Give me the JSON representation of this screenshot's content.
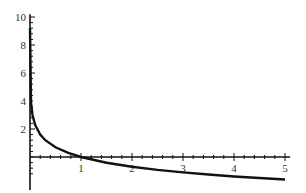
{
  "chart_data": {
    "type": "line",
    "title": "",
    "xlabel": "",
    "ylabel": "",
    "xlim": [
      0,
      5
    ],
    "ylim": [
      -1.7,
      10
    ],
    "grid": false,
    "legend": null,
    "x_ticks": [
      1,
      2,
      3,
      4,
      5
    ],
    "y_ticks": [
      2,
      4,
      6,
      8,
      10
    ],
    "x_tick_labels": [
      "1",
      "2",
      "3",
      "4",
      "5"
    ],
    "y_tick_labels": [
      "2",
      "4",
      "6",
      "8",
      "10"
    ],
    "series": [
      {
        "name": "f(x) = -ln(x)",
        "x": [
          0.0001,
          0.02,
          0.05,
          0.1,
          0.2,
          0.3,
          0.5,
          0.75,
          1,
          1.5,
          2,
          2.5,
          3,
          3.5,
          4,
          4.5,
          5
        ],
        "y": [
          9.2,
          3.91,
          3.0,
          2.3,
          1.61,
          1.2,
          0.69,
          0.29,
          0,
          -0.41,
          -0.69,
          -0.92,
          -1.1,
          -1.25,
          -1.39,
          -1.5,
          -1.61
        ]
      }
    ]
  }
}
